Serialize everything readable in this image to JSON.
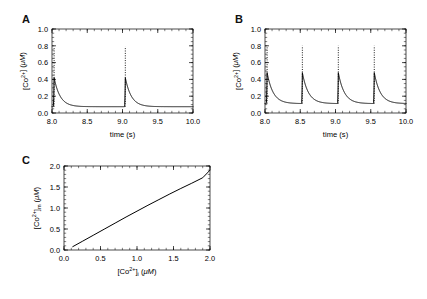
{
  "figure": {
    "panels": [
      "A",
      "B",
      "C"
    ]
  },
  "chart_data": [
    {
      "id": "A",
      "type": "line",
      "title": "",
      "panel_label": "A",
      "xlabel": "time (s)",
      "ylabel": "[Co2+] (uM)",
      "ylabel_parts": {
        "pre": "[Co",
        "sup": "2+",
        "post": "] (",
        "unit": "μM",
        "close": ")"
      },
      "xlim": [
        8.0,
        10.0
      ],
      "ylim": [
        0.0,
        1.0
      ],
      "xticks": [
        8.0,
        8.5,
        9.0,
        9.5,
        10.0
      ],
      "xticklabels": [
        "8.0",
        "8.5",
        "9.0",
        "9.5",
        "10.0"
      ],
      "yticks": [
        0.0,
        0.2,
        0.4,
        0.6,
        0.8,
        1.0
      ],
      "yticklabels": [
        "0.0",
        "0.2",
        "0.4",
        "0.6",
        "0.8",
        "1.0"
      ],
      "grid": false,
      "legend": "none",
      "baseline": 0.075,
      "spike_times": [
        8.03,
        9.04
      ],
      "spike_peak": 0.42,
      "dotted_peak": 0.79,
      "decay_tau": 0.085,
      "rise_width": 0.012,
      "period_s": 1.0
    },
    {
      "id": "B",
      "type": "line",
      "title": "",
      "panel_label": "B",
      "xlabel": "time (s)",
      "ylabel": "[Co2+] (uM)",
      "ylabel_parts": {
        "pre": "[Co",
        "sup": "2+",
        "post": "] (",
        "unit": "μM",
        "close": ")"
      },
      "xlim": [
        8.0,
        10.0
      ],
      "ylim": [
        0.0,
        1.0
      ],
      "xticks": [
        8.0,
        8.5,
        9.0,
        9.5,
        10.0
      ],
      "xticklabels": [
        "8.0",
        "8.5",
        "9.0",
        "9.5",
        "10.0"
      ],
      "yticks": [
        0.0,
        0.2,
        0.4,
        0.6,
        0.8,
        1.0
      ],
      "yticklabels": [
        "0.0",
        "0.2",
        "0.4",
        "0.6",
        "0.8",
        "1.0"
      ],
      "grid": false,
      "legend": "none",
      "baseline": 0.112,
      "spike_times": [
        8.03,
        8.53,
        9.04,
        9.55
      ],
      "spike_peak": 0.48,
      "dotted_peak": 0.8,
      "decay_tau": 0.085,
      "rise_width": 0.012,
      "period_s": 0.5
    },
    {
      "id": "C",
      "type": "line",
      "title": "",
      "panel_label": "C",
      "xlabel": "[Co2+]i (uM)",
      "xlabel_parts": {
        "pre": "[Co",
        "sup": "2+",
        "mid": "]",
        "sub": "i",
        "post": " (",
        "unit": "μM",
        "close": ")"
      },
      "ylabel": "[Co2+]m (uM)",
      "ylabel_parts": {
        "pre": "[Co",
        "sup": "2+",
        "mid": "]",
        "sub": "m",
        "post": " (",
        "unit": "μM",
        "close": ")"
      },
      "xlim": [
        0.0,
        2.0
      ],
      "ylim": [
        0.0,
        2.0
      ],
      "xticks": [
        0.0,
        0.5,
        1.0,
        1.5,
        2.0
      ],
      "xticklabels": [
        "0.0",
        "0.5",
        "1.0",
        "1.5",
        "2.0"
      ],
      "yticks": [
        0.0,
        0.5,
        1.0,
        1.5,
        2.0
      ],
      "yticklabels": [
        "0.0",
        "0.5",
        "1.0",
        "1.5",
        "2.0"
      ],
      "grid": false,
      "legend": "none",
      "x": [
        0.12,
        0.25,
        0.4,
        0.55,
        0.7,
        0.85,
        1.0,
        1.15,
        1.3,
        1.45,
        1.6,
        1.75,
        1.9,
        2.0
      ],
      "y": [
        0.08,
        0.205,
        0.35,
        0.495,
        0.64,
        0.785,
        0.925,
        1.065,
        1.2,
        1.335,
        1.465,
        1.59,
        1.72,
        1.9
      ]
    }
  ]
}
